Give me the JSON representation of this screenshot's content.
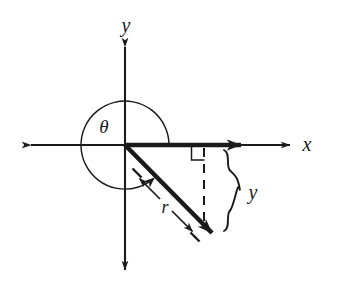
{
  "figure": {
    "type": "geometry-diagram",
    "background_color": "#ffffff",
    "ink_color": "#1a1a1a",
    "labels": {
      "x_axis": "x",
      "y_axis": "y",
      "angle": "θ",
      "radius": "r",
      "vertical_leg": "y"
    },
    "geometry": {
      "origin": {
        "x": 125,
        "y": 145
      },
      "x_axis": {
        "x1": 30,
        "y1": 145,
        "x2": 292,
        "y2": 145,
        "arrows": "both"
      },
      "y_axis": {
        "x1": 125,
        "y1": 45,
        "x2": 125,
        "y2": 272,
        "arrows": "both"
      },
      "angle_arc": {
        "center": {
          "x": 125,
          "y": 145
        },
        "radius": 44,
        "start_angle_deg": 0,
        "end_angle_deg": 311,
        "direction": "counterclockwise",
        "arrowhead": "end"
      },
      "x_component_vector": {
        "x1": 125,
        "y1": 145,
        "x2": 254,
        "y2": 145,
        "weight": "bold"
      },
      "terminal_ray": {
        "x1": 125,
        "y1": 145,
        "x2": 223,
        "y2": 244,
        "weight": "bold",
        "arrowhead": "end"
      },
      "dashed_drop_line": {
        "x1": 204,
        "y1": 148,
        "x2": 204,
        "y2": 224
      },
      "right_angle_marker": {
        "x": 192,
        "y": 147,
        "size": 13
      },
      "brace": {
        "x": 228,
        "y_top": 150,
        "y_bottom": 231,
        "label_x": 252,
        "label_y": 193
      },
      "r_dimension": {
        "label_position": {
          "x": 163,
          "y": 207
        },
        "arrow_toward_origin": {
          "x1": 160,
          "y1": 198,
          "x2": 136,
          "y2": 174
        },
        "arrow_away_from_origin": {
          "x1": 172,
          "y1": 212,
          "x2": 196,
          "y2": 236
        }
      }
    }
  }
}
